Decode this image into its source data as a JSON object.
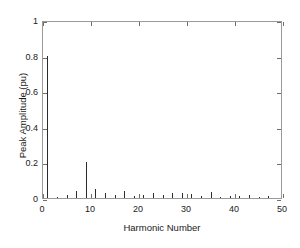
{
  "chart_data": {
    "type": "bar",
    "title": "",
    "subtitle": "",
    "xlabel": "Harmonic Number",
    "ylabel": "Peak Amplitude (pu)",
    "xlim": [
      0,
      50
    ],
    "ylim": [
      0,
      1
    ],
    "xticks": [
      0,
      10,
      20,
      30,
      40,
      50
    ],
    "xtick_labels": [
      "0",
      "10",
      "20",
      "30",
      "40",
      "50"
    ],
    "yticks": [
      0,
      0.2,
      0.4,
      0.6,
      0.8,
      1
    ],
    "ytick_labels": [
      "0",
      "0.2",
      "0.4",
      "0.6",
      "0.8",
      "1"
    ],
    "grid": false,
    "legend": null,
    "legend_position": "none",
    "series_color": "#2b2b2b",
    "categories": [
      1,
      3,
      5,
      7,
      9,
      11,
      13,
      15,
      17,
      19,
      21,
      23,
      25,
      27,
      29,
      31,
      33,
      35,
      37,
      39,
      41,
      43,
      45,
      47
    ],
    "values": [
      0.8,
      0.008,
      0.018,
      0.038,
      0.2,
      0.048,
      0.03,
      0.018,
      0.042,
      0.014,
      0.016,
      0.028,
      0.018,
      0.026,
      0.03,
      0.022,
      0.012,
      0.032,
      0.006,
      0.01,
      0.012,
      0.018,
      0.006,
      0.014
    ],
    "series": [
      {
        "name": "Peak Amplitude",
        "values": [
          0.8,
          0.008,
          0.018,
          0.038,
          0.2,
          0.048,
          0.03,
          0.018,
          0.042,
          0.014,
          0.016,
          0.028,
          0.018,
          0.026,
          0.03,
          0.022,
          0.012,
          0.032,
          0.006,
          0.01,
          0.012,
          0.018,
          0.006,
          0.014
        ]
      }
    ],
    "annotations": []
  }
}
